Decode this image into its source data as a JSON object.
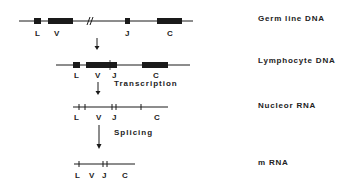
{
  "diagram": {
    "rows": [
      {
        "id": "germline",
        "label": "Germ line DNA",
        "segments": {
          "L": "L",
          "V": "V",
          "J": "J",
          "C": "C"
        }
      },
      {
        "id": "lymphocyte",
        "label": "Lymphocyte DNA",
        "segments": {
          "L": "L",
          "V": "V",
          "J": "J",
          "C": "C"
        }
      },
      {
        "id": "nuclear-rna",
        "label": "Nucleor RNA",
        "segments": {
          "L": "L",
          "V": "V",
          "J": "J",
          "C": "C"
        }
      },
      {
        "id": "mrna",
        "label": "m RNA",
        "segments": {
          "L": "L",
          "V": "V",
          "J": "J",
          "C": "C"
        }
      }
    ],
    "steps": {
      "transcription": "Transcription",
      "splicing": "Splicing"
    },
    "colors": {
      "ink": "#1a1a1a",
      "background": "#ffffff"
    }
  }
}
